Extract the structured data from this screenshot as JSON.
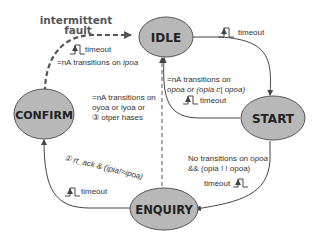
{
  "diagram": {
    "type": "state-machine",
    "colors": {
      "state_fill": "#b8b8b8",
      "state_stroke": "#555555",
      "edge": "#444444",
      "fault_edge": "#555555",
      "text": "#333333"
    },
    "states": [
      {
        "id": "idle",
        "label": "IDLE"
      },
      {
        "id": "start",
        "label": "START"
      },
      {
        "id": "enquiry",
        "label": "ENQUIRY"
      },
      {
        "id": "confirm",
        "label": "CONFIRM"
      }
    ],
    "annotations": {
      "fault_line1": "intermittent",
      "fault_line2": "fault",
      "confirm_idle_timeout": "timeout",
      "confirm_idle_cond_prefix": "=nA transitions on ",
      "confirm_idle_cond_var": "ipoa",
      "idle_start_timeout": "timeout",
      "start_idle_cond1": "=nA transitions on",
      "start_idle_cond2": "opoa or (opia c| opoa)",
      "start_idle_timeout": "timeout",
      "enquiry_idle_cond1": "=nA transitions on",
      "enquiry_idle_cond2": "oyoa or iyoa or",
      "enquiry_idle_cond3": "③ otper hases",
      "start_enquiry_cond1_prefix": "No transitions on ",
      "start_enquiry_cond1_var": "opoa",
      "start_enquiry_cond2": "&& (opia ! ! opoa)",
      "start_enquiry_timeout": "timeout",
      "enquiry_confirm_cond": "① rt_ack & (ipia!=ipoa)",
      "enquiry_confirm_timeout": "timeout"
    }
  }
}
